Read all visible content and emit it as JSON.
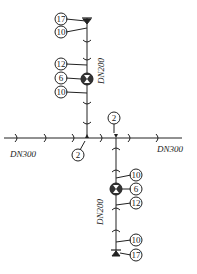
{
  "diagram": {
    "type": "piping-schematic",
    "main_line": {
      "label": "DN300",
      "label_left": "DN300",
      "label_right": "DN300"
    },
    "branches": [
      {
        "id": "upper-branch",
        "size_label": "DN200",
        "callouts": [
          {
            "number": "17",
            "refers_to": "end-cap-valve"
          },
          {
            "number": "10",
            "refers_to": "pipe-fitting"
          },
          {
            "number": "12",
            "refers_to": "fitting"
          },
          {
            "number": "6",
            "refers_to": "gate-valve"
          },
          {
            "number": "10",
            "refers_to": "pipe-fitting"
          }
        ]
      },
      {
        "id": "lower-branch",
        "size_label": "DN200",
        "callouts": [
          {
            "number": "10",
            "refers_to": "pipe-fitting"
          },
          {
            "number": "6",
            "refers_to": "gate-valve"
          },
          {
            "number": "12",
            "refers_to": "fitting"
          },
          {
            "number": "10",
            "refers_to": "pipe-fitting"
          },
          {
            "number": "17",
            "refers_to": "end-cap-valve"
          }
        ]
      }
    ],
    "tee_callouts": [
      {
        "number": "2",
        "position": "upper-right-tee"
      },
      {
        "number": "2",
        "position": "lower-left-tee"
      }
    ],
    "colors": {
      "line": "#222222",
      "background": "#ffffff"
    }
  }
}
